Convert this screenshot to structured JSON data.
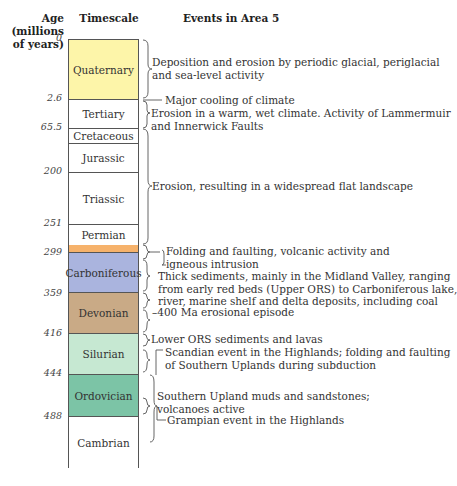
{
  "headers": {
    "age": "Age (millions of years)",
    "timescale": "Timescale",
    "events": "Events in Area 5"
  },
  "ages": [
    "0",
    "2.6",
    "65.5",
    "200",
    "251",
    "299",
    "359",
    "416",
    "444",
    "488"
  ],
  "periods": [
    {
      "name": "Quaternary",
      "color": "#fdf5a9"
    },
    {
      "name": "Tertiary",
      "color": "#ffffff"
    },
    {
      "name": "Cretaceous",
      "color": "#ffffff"
    },
    {
      "name": "Jurassic",
      "color": "#ffffff"
    },
    {
      "name": "Triassic",
      "color": "#ffffff"
    },
    {
      "name": "Permian",
      "color": "#ffffff"
    },
    {
      "name": "",
      "color": "#f6b26b"
    },
    {
      "name": "Carboniferous",
      "color": "#aab4de"
    },
    {
      "name": "Devonian",
      "color": "#c9aa86"
    },
    {
      "name": "Silurian",
      "color": "#c6e8d2"
    },
    {
      "name": "Ordovician",
      "color": "#7cc4a6"
    },
    {
      "name": "Cambrian",
      "color": "#ffffff"
    }
  ],
  "events": [
    {
      "line1": "Deposition and erosion by periodic glacial, periglacial",
      "line2": "and sea-level activity"
    },
    {
      "line1": "Major cooling of climate"
    },
    {
      "line1": "Erosion in a warm, wet climate. Activity of Lammermuir",
      "line2": "and Innerwick Faults"
    },
    {
      "line1": "Erosion, resulting in a widespread flat landscape"
    },
    {
      "line1": "Folding and faulting, volcanic activity and",
      "line2": "igneous intrusion"
    },
    {
      "line1": "Thick sediments, mainly in the Midland Valley, ranging",
      "line2": "from early red beds (Upper ORS) to Carboniferous lake,",
      "line3": "river, marine shelf and delta deposits, including coal"
    },
    {
      "line1": "400 Ma erosional episode"
    },
    {
      "line1": "Lower ORS sediments and lavas"
    },
    {
      "line1": "Scandian event in the Highlands; folding and faulting",
      "line2": "of Southern Uplands during subduction"
    },
    {
      "line1": "Southern Upland muds and sandstones;",
      "line2": "volcanoes active"
    },
    {
      "line1": "Grampian event in the Highlands"
    }
  ]
}
